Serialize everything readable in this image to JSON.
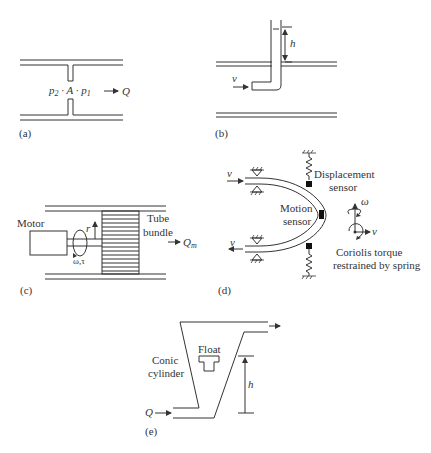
{
  "figure": {
    "panels": [
      {
        "id": "a",
        "label": "(a)",
        "equation": {
          "p2": "p",
          "p2_sub": "2",
          "mid": " · A · ",
          "p1": "p",
          "p1_sub": "1"
        },
        "flow_label": "Q"
      },
      {
        "id": "b",
        "label": "(b)",
        "velocity_label": "v",
        "height_label": "h"
      },
      {
        "id": "c",
        "label": "(c)",
        "motor_label": "Motor",
        "radius_label": "r",
        "omega_tau_label": "ω,τ",
        "tube_bundle_line1": "Tube",
        "tube_bundle_line2": "bundle",
        "flow_label": "Q",
        "flow_sub": "m"
      },
      {
        "id": "d",
        "label": "(d)",
        "velocity_in_label": "v",
        "velocity_out_label": "v",
        "displacement_line1": "Displacement",
        "displacement_line2": "sensor",
        "motion_line1": "Motion",
        "motion_line2": "sensor",
        "omega_label": "ω",
        "axis_v_label": "v",
        "coriolis_line1": "Coriolis torque",
        "coriolis_line2": "restrained by spring"
      },
      {
        "id": "e",
        "label": "(e)",
        "float_label": "Float",
        "conic_line1": "Conic",
        "conic_line2": "cylinder",
        "height_label": "h",
        "flow_label": "Q"
      }
    ]
  }
}
